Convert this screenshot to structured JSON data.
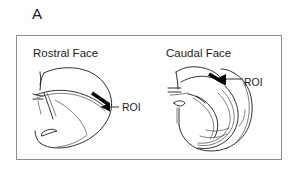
{
  "figure": {
    "panel_letter": "A",
    "background_color": "#fdfdfd",
    "box_border_color": "#8d8d8d",
    "ink_color": "#1a1a1a",
    "roi_bar_color": "#000000"
  },
  "panels": [
    {
      "id": "rostral",
      "title": "Rostral Face",
      "annotation": "ROI",
      "description": "line drawing of rostral coronal brain section with thick black ROI bar on dorsal hippocampus"
    },
    {
      "id": "caudal",
      "title": "Caudal Face",
      "annotation": "ROI",
      "description": "line drawing of caudal coronal brain section with thick black ROI bar on dorsal hippocampus"
    }
  ]
}
